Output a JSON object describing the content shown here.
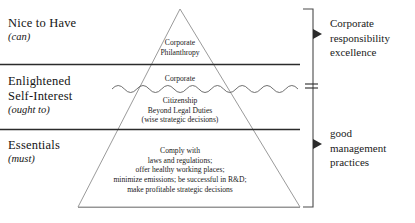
{
  "diagram": {
    "levels": [
      {
        "id": "nice-to-have",
        "title": "Nice to Have",
        "qualifier": "(can)"
      },
      {
        "id": "enlightened-self-interest",
        "title_line1": "Enlightened",
        "title_line2": "Self-Interest",
        "qualifier": "(ought to)"
      },
      {
        "id": "essentials",
        "title": "Essentials",
        "qualifier": "(must)"
      }
    ],
    "tiers": {
      "top": {
        "lines": [
          "Corporate",
          "Philanthropy"
        ]
      },
      "middle_above_wave": {
        "lines": [
          "Corporate"
        ]
      },
      "middle_below_wave": {
        "lines": [
          "Citizenship",
          "Beyond Legal Duties",
          "(wise strategic decisions)"
        ]
      },
      "bottom": {
        "lines": [
          "Comply with",
          "laws and regulations;",
          "offer healthy working places;",
          "minimize emissions; be successful in R&D;",
          "make profitable strategic decisions"
        ]
      }
    },
    "bracket": {
      "upper_label": [
        "Corporate",
        "responsibility",
        "excellence"
      ],
      "lower_label": [
        "good",
        "management",
        "practices"
      ],
      "equals_sign": "="
    },
    "colors": {
      "ink": "#1a1a1a",
      "rule": "#2b2b2b",
      "outline": "#8a8a8a",
      "background": "#ffffff"
    }
  }
}
